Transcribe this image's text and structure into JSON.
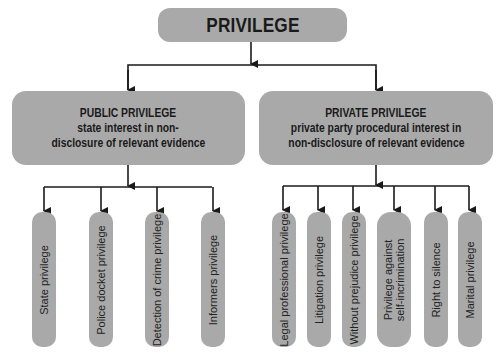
{
  "root": {
    "label": "PRIVILEGE"
  },
  "public": {
    "title": "PUBLIC PRIVILEGE",
    "line1": "state interest in non-",
    "line2": "disclosure of relevant evidence",
    "children": [
      {
        "label": "State privilege"
      },
      {
        "label": "Police docket privilege"
      },
      {
        "label": "Detection of crime privilege"
      },
      {
        "label": "Informers privilege"
      }
    ]
  },
  "private": {
    "title": "PRIVATE PRIVILEGE",
    "line1": "private party procedural interest in",
    "line2": "non-disclosure of relevant evidence",
    "children": [
      {
        "label": "Legal professional privilege"
      },
      {
        "label": "Litigation privilege"
      },
      {
        "label": "Without prejudice privilege"
      },
      {
        "label": "Privilege against",
        "label2": "self-incrimination"
      },
      {
        "label": "Right to silence"
      },
      {
        "label": "Marital privilege"
      }
    ]
  },
  "colors": {
    "box": "#a9a9a9",
    "line": "#1a1a1a",
    "background": "#ffffff"
  }
}
